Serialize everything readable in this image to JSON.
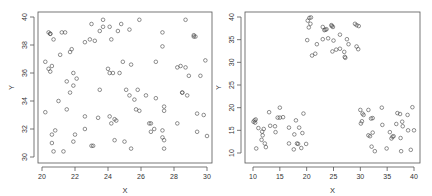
{
  "chart_data": [
    {
      "type": "scatter",
      "title": "",
      "xlabel": "X",
      "ylabel": "Y",
      "xlim": [
        20,
        30
      ],
      "ylim": [
        30,
        40
      ],
      "xticks": [
        20,
        22,
        24,
        26,
        28,
        30
      ],
      "yticks": [
        30,
        32,
        34,
        36,
        38,
        40
      ],
      "grid": false,
      "legend": null,
      "marker": "open-circle",
      "points": [
        [
          20.2,
          36.8
        ],
        [
          20.4,
          38.9
        ],
        [
          20.5,
          38.8
        ],
        [
          20.5,
          38.8
        ],
        [
          20.7,
          38.4
        ],
        [
          21.2,
          38.9
        ],
        [
          21.4,
          38.9
        ],
        [
          21.1,
          37.3
        ],
        [
          21.7,
          37.5
        ],
        [
          21.8,
          37.7
        ],
        [
          20.4,
          36.3
        ],
        [
          20.5,
          36.1
        ],
        [
          20.6,
          36.5
        ],
        [
          21.9,
          36.0
        ],
        [
          22.1,
          35.6
        ],
        [
          21.5,
          35.4
        ],
        [
          21.9,
          35.1
        ],
        [
          21.7,
          34.6
        ],
        [
          21.0,
          34.0
        ],
        [
          21.5,
          33.4
        ],
        [
          20.2,
          33.2
        ],
        [
          22.6,
          32.9
        ],
        [
          23.4,
          32.8
        ],
        [
          24.1,
          32.9
        ],
        [
          24.4,
          32.7
        ],
        [
          24.5,
          32.6
        ],
        [
          24.2,
          32.4
        ],
        [
          22.6,
          32.0
        ],
        [
          20.8,
          31.9
        ],
        [
          22.0,
          31.6
        ],
        [
          20.6,
          31.6
        ],
        [
          20.6,
          31.0
        ],
        [
          21.9,
          31.1
        ],
        [
          20.7,
          30.4
        ],
        [
          21.3,
          30.4
        ],
        [
          23.0,
          30.8
        ],
        [
          23.1,
          30.8
        ],
        [
          24.4,
          31.2
        ],
        [
          25.0,
          31.1
        ],
        [
          25.4,
          30.6
        ],
        [
          23.0,
          39.5
        ],
        [
          23.7,
          39.8
        ],
        [
          23.7,
          39.3
        ],
        [
          24.1,
          39.3
        ],
        [
          24.8,
          39.5
        ],
        [
          23.5,
          39.0
        ],
        [
          24.6,
          39.0
        ],
        [
          25.3,
          39.1
        ],
        [
          22.9,
          38.4
        ],
        [
          22.6,
          38.2
        ],
        [
          23.2,
          38.3
        ],
        [
          24.2,
          38.4
        ],
        [
          25.9,
          39.8
        ],
        [
          24.9,
          36.8
        ],
        [
          25.4,
          36.6
        ],
        [
          24.0,
          36.3
        ],
        [
          24.1,
          36.0
        ],
        [
          24.3,
          36.0
        ],
        [
          24.7,
          36.0
        ],
        [
          23.5,
          34.8
        ],
        [
          25.1,
          34.8
        ],
        [
          25.3,
          34.4
        ],
        [
          25.6,
          34.1
        ],
        [
          25.8,
          34.8
        ],
        [
          26.3,
          34.4
        ],
        [
          26.9,
          34.2
        ],
        [
          25.7,
          33.4
        ],
        [
          25.9,
          33.3
        ],
        [
          26.5,
          32.4
        ],
        [
          26.6,
          32.4
        ],
        [
          26.6,
          31.8
        ],
        [
          26.8,
          32.0
        ],
        [
          27.3,
          31.9
        ],
        [
          27.3,
          31.4
        ],
        [
          27.4,
          31.2
        ],
        [
          27.4,
          30.6
        ],
        [
          27.4,
          33.6
        ],
        [
          27.4,
          33.3
        ],
        [
          27.3,
          38.9
        ],
        [
          27.3,
          37.9
        ],
        [
          26.9,
          36.8
        ],
        [
          28.7,
          39.8
        ],
        [
          29.2,
          38.6
        ],
        [
          29.2,
          38.7
        ],
        [
          29.3,
          38.6
        ],
        [
          28.2,
          36.4
        ],
        [
          28.4,
          36.5
        ],
        [
          28.7,
          36.4
        ],
        [
          28.9,
          35.8
        ],
        [
          29.6,
          35.8
        ],
        [
          29.9,
          36.9
        ],
        [
          28.5,
          34.6
        ],
        [
          28.5,
          34.6
        ],
        [
          28.8,
          34.4
        ],
        [
          28.2,
          32.4
        ],
        [
          29.4,
          33.1
        ],
        [
          29.8,
          33.0
        ],
        [
          29.4,
          31.8
        ],
        [
          30.0,
          31.5
        ]
      ]
    },
    {
      "type": "scatter",
      "title": "",
      "xlabel": "X",
      "ylabel": "Y",
      "xlim": [
        10,
        40
      ],
      "ylim": [
        10,
        40
      ],
      "xticks": [
        10,
        15,
        20,
        25,
        30,
        35,
        40
      ],
      "yticks": [
        10,
        15,
        20,
        25,
        30,
        35,
        40
      ],
      "grid": false,
      "legend": null,
      "marker": "open-circle",
      "clusters": [
        "top-center (x 20-30, y 30-40)",
        "bottom-left (x 10-20, y 10-20)",
        "bottom-right (x 30-40, y 10-20)"
      ],
      "points": [
        [
          20.2,
          39.2
        ],
        [
          20.5,
          39.8
        ],
        [
          20.8,
          39.9
        ],
        [
          20.4,
          37.7
        ],
        [
          20.7,
          38.5
        ],
        [
          20.1,
          34.9
        ],
        [
          21.9,
          34.0
        ],
        [
          21.0,
          31.5
        ],
        [
          21.6,
          31.9
        ],
        [
          23.0,
          37.8
        ],
        [
          23.3,
          37.1
        ],
        [
          23.5,
          37.2
        ],
        [
          23.7,
          37.3
        ],
        [
          24.6,
          38.2
        ],
        [
          24.7,
          38.0
        ],
        [
          24.9,
          37.8
        ],
        [
          23.0,
          35.1
        ],
        [
          24.0,
          35.3
        ],
        [
          25.0,
          34.8
        ],
        [
          24.8,
          32.4
        ],
        [
          25.5,
          32.8
        ],
        [
          26.2,
          33.0
        ],
        [
          26.2,
          36.1
        ],
        [
          27.0,
          32.3
        ],
        [
          27.1,
          31.2
        ],
        [
          27.2,
          31.0
        ],
        [
          27.5,
          35.1
        ],
        [
          27.8,
          34.0
        ],
        [
          29.0,
          38.5
        ],
        [
          29.3,
          38.2
        ],
        [
          29.7,
          38.0
        ],
        [
          29.3,
          33.5
        ],
        [
          29.6,
          32.9
        ],
        [
          10.1,
          16.9
        ],
        [
          10.3,
          17.2
        ],
        [
          10.4,
          16.7
        ],
        [
          10.5,
          17.4
        ],
        [
          10.6,
          11.0
        ],
        [
          11.0,
          15.5
        ],
        [
          11.6,
          12.9
        ],
        [
          11.7,
          14.7
        ],
        [
          11.8,
          13.9
        ],
        [
          12.0,
          15.3
        ],
        [
          12.2,
          12.1
        ],
        [
          12.4,
          11.3
        ],
        [
          13.0,
          19.0
        ],
        [
          13.2,
          16.0
        ],
        [
          14.1,
          15.9
        ],
        [
          14.2,
          14.6
        ],
        [
          14.6,
          17.8
        ],
        [
          15.0,
          20.0
        ],
        [
          15.0,
          17.8
        ],
        [
          15.6,
          17.9
        ],
        [
          16.7,
          15.6
        ],
        [
          16.7,
          12.1
        ],
        [
          17.6,
          10.8
        ],
        [
          17.7,
          14.1
        ],
        [
          18.0,
          17.2
        ],
        [
          18.2,
          12.1
        ],
        [
          18.4,
          12.0
        ],
        [
          18.6,
          15.6
        ],
        [
          19.0,
          11.1
        ],
        [
          19.2,
          14.4
        ],
        [
          19.4,
          18.7
        ],
        [
          19.9,
          12.0
        ],
        [
          30.0,
          19.5
        ],
        [
          30.1,
          16.5
        ],
        [
          30.3,
          17.0
        ],
        [
          30.6,
          18.4
        ],
        [
          30.4,
          18.7
        ],
        [
          31.5,
          19.5
        ],
        [
          31.5,
          13.9
        ],
        [
          31.8,
          13.7
        ],
        [
          32.0,
          17.6
        ],
        [
          32.3,
          17.7
        ],
        [
          32.1,
          11.4
        ],
        [
          32.3,
          14.5
        ],
        [
          32.7,
          10.4
        ],
        [
          34.0,
          20.0
        ],
        [
          34.1,
          16.2
        ],
        [
          34.9,
          11.0
        ],
        [
          35.5,
          14.6
        ],
        [
          35.8,
          13.2
        ],
        [
          36.0,
          13.6
        ],
        [
          36.2,
          13.7
        ],
        [
          36.7,
          16.4
        ],
        [
          36.9,
          18.8
        ],
        [
          37.4,
          18.6
        ],
        [
          37.5,
          13.3
        ],
        [
          37.6,
          10.4
        ],
        [
          37.8,
          16.9
        ],
        [
          37.9,
          15.9
        ],
        [
          38.8,
          18.4
        ],
        [
          38.9,
          15.0
        ],
        [
          39.4,
          10.7
        ],
        [
          39.7,
          20.1
        ],
        [
          40.0,
          15.0
        ]
      ]
    }
  ],
  "colors": {
    "point_stroke": "#444444",
    "axis": "#555555",
    "background": "#ffffff"
  }
}
